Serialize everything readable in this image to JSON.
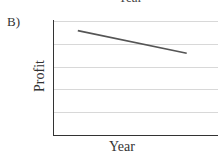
{
  "panel": {
    "label": "B)",
    "top_cut_text": "Year"
  },
  "chart_data": {
    "type": "line",
    "title": "",
    "xlabel": "Year",
    "ylabel": "Profit",
    "x_ticks": [],
    "y_ticks": [],
    "grid": true,
    "gridlines_y_count": 5,
    "legend": null,
    "ylim": [
      0,
      5
    ],
    "xlim": [
      0,
      1
    ],
    "series": [
      {
        "name": "Profit",
        "color": "#555555",
        "x": [
          0.15,
          0.81
        ],
        "y": [
          4.6,
          3.6
        ]
      }
    ],
    "trend": "decreasing"
  },
  "colors": {
    "axis": "#333333",
    "grid": "#d8d8d8",
    "line": "#555555"
  }
}
